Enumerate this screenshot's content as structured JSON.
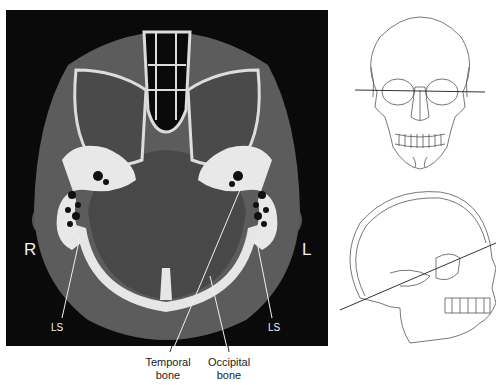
{
  "ct_image": {
    "orientation": {
      "right": "R",
      "left": "L"
    },
    "labels": {
      "ls_right_side": "LS",
      "ls_left_side": "LS"
    }
  },
  "captions": {
    "temporal_bone": {
      "line1": "Temporal",
      "line2": "bone"
    },
    "occipital_bone": {
      "line1": "Occipital",
      "line2": "bone"
    }
  },
  "diagrams": {
    "frontal_skull": "frontal-skull-with-scan-plane",
    "lateral_skull": "lateral-skull-with-scan-plane"
  },
  "colors": {
    "ct_background": "#0a0a0a",
    "soft_tissue": "#5a5a5a",
    "brain": "#4a4a4a",
    "bone": "#e8e8e8",
    "line_art": "#555555"
  }
}
